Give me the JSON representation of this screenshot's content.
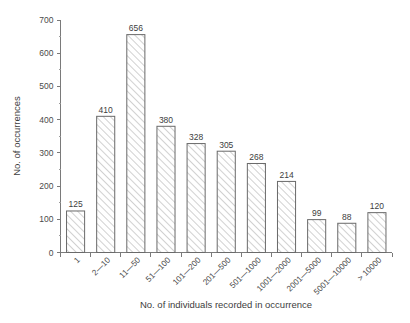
{
  "chart_data": {
    "type": "bar",
    "title": "",
    "subtitle": "",
    "xlabel": "No. of individuals recorded in occurrence",
    "ylabel": "No. of occurrences",
    "categories": [
      "1",
      "2—10",
      "11—50",
      "51—100",
      "101—200",
      "201—500",
      "501—1000",
      "1001—2000",
      "2001—5000",
      "5001—10000",
      "> 10000"
    ],
    "values": [
      125,
      410,
      656,
      380,
      328,
      305,
      268,
      214,
      99,
      88,
      120
    ],
    "value_labels": [
      "125",
      "410",
      "656",
      "380",
      "328",
      "305",
      "268",
      "214",
      "99",
      "88",
      "120"
    ],
    "ylim": [
      0,
      700
    ],
    "ytick_labels": [
      "0",
      "100",
      "200",
      "300",
      "400",
      "500",
      "600",
      "700"
    ],
    "ytick_values": [
      0,
      100,
      200,
      300,
      400,
      500,
      600,
      700
    ],
    "yminor_values": [
      50,
      150,
      250,
      350,
      450,
      550,
      650
    ],
    "grid": false,
    "legend": null,
    "bar_style": "diagonal-hatch",
    "xtick_label_rotation": -45,
    "colors": {
      "axis": "#7a7a7a",
      "bar_edge": "#6a6a6a",
      "hatch": "#8f8f8f",
      "bar_fill": "#ffffff",
      "text": "#3d3d3d",
      "background": "#ffffff"
    }
  }
}
